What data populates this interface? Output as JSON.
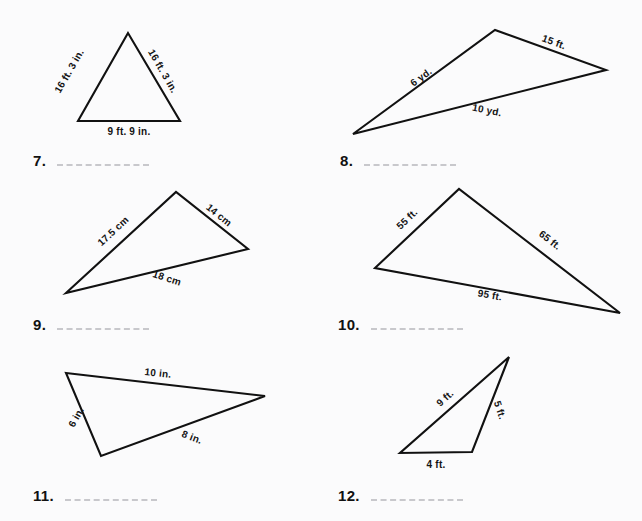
{
  "page": {
    "background_color": "#fbfbfc",
    "ink_color": "#111111",
    "blank_color": "#c8c8cc",
    "width": 642,
    "height": 521
  },
  "problems": [
    {
      "id": "p7",
      "number": "7.",
      "number_pos": {
        "x": 33,
        "y": 152
      },
      "blank_width": 92,
      "shape": "triangle",
      "points": "128,33 78,121 180,121",
      "labels": [
        {
          "name": "side-label-left",
          "text": "16 ft. 3 in.",
          "x": 69,
          "y": 71,
          "rotate": -60
        },
        {
          "name": "side-label-right",
          "text": "16 ft. 3 in.",
          "x": 163,
          "y": 71,
          "rotate": 60
        },
        {
          "name": "side-label-base",
          "text": "9 ft. 9 in.",
          "x": 129,
          "y": 131,
          "rotate": 0
        }
      ]
    },
    {
      "id": "p8",
      "number": "8.",
      "number_pos": {
        "x": 340,
        "y": 152
      },
      "blank_width": 92,
      "shape": "triangle",
      "points": "353,134 495,30 606,70",
      "labels": [
        {
          "name": "side-label-upper-left",
          "text": "6 yd.",
          "x": 421,
          "y": 77,
          "rotate": -36
        },
        {
          "name": "side-label-upper-right",
          "text": "15 ft.",
          "x": 554,
          "y": 42,
          "rotate": 20
        },
        {
          "name": "side-label-base",
          "text": "10 yd.",
          "x": 487,
          "y": 110,
          "rotate": 11
        }
      ]
    },
    {
      "id": "p9",
      "number": "9.",
      "number_pos": {
        "x": 33,
        "y": 316
      },
      "blank_width": 92,
      "shape": "triangle",
      "points": "66,293 176,192 248,249",
      "labels": [
        {
          "name": "side-label-left",
          "text": "17.5 cm",
          "x": 113,
          "y": 231,
          "rotate": -43
        },
        {
          "name": "side-label-right",
          "text": "14 cm",
          "x": 219,
          "y": 215,
          "rotate": 39
        },
        {
          "name": "side-label-base",
          "text": "18 cm",
          "x": 167,
          "y": 278,
          "rotate": 18
        }
      ]
    },
    {
      "id": "p10",
      "number": "10.",
      "number_pos": {
        "x": 338,
        "y": 316
      },
      "blank_width": 92,
      "shape": "triangle",
      "points": "375,268 459,189 620,313",
      "labels": [
        {
          "name": "side-label-left",
          "text": "55 ft.",
          "x": 407,
          "y": 219,
          "rotate": -44
        },
        {
          "name": "side-label-right",
          "text": "65 ft.",
          "x": 550,
          "y": 240,
          "rotate": 38
        },
        {
          "name": "side-label-base",
          "text": "95 ft.",
          "x": 490,
          "y": 295,
          "rotate": 10
        }
      ]
    },
    {
      "id": "p11",
      "number": "11.",
      "number_pos": {
        "x": 33,
        "y": 487
      },
      "blank_width": 92,
      "shape": "triangle",
      "points": "66,373 265,396 101,456",
      "labels": [
        {
          "name": "side-label-top",
          "text": "10 in.",
          "x": 158,
          "y": 373,
          "rotate": 6
        },
        {
          "name": "side-label-left",
          "text": "6 in.",
          "x": 76,
          "y": 417,
          "rotate": -61
        },
        {
          "name": "side-label-base",
          "text": "8 in.",
          "x": 192,
          "y": 437,
          "rotate": 21
        }
      ]
    },
    {
      "id": "p12",
      "number": "12.",
      "number_pos": {
        "x": 338,
        "y": 487
      },
      "blank_width": 92,
      "shape": "triangle",
      "points": "509,357 400,453 472,452",
      "labels": [
        {
          "name": "side-label-hypotenuse",
          "text": "9 ft.",
          "x": 445,
          "y": 398,
          "rotate": -42
        },
        {
          "name": "side-label-right",
          "text": "5 ft.",
          "x": 500,
          "y": 410,
          "rotate": 72
        },
        {
          "name": "side-label-base",
          "text": "4 ft.",
          "x": 436,
          "y": 464,
          "rotate": 0
        }
      ]
    }
  ]
}
